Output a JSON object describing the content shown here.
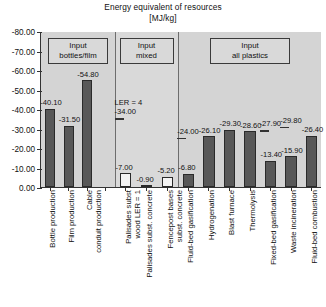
{
  "chart_data": {
    "type": "bar",
    "title": "Energy equivalent of resources",
    "subtitle": "[MJ/kg]",
    "xlabel": "",
    "ylabel": "",
    "ylim": [
      0,
      -80
    ],
    "y_ticks": [
      "0.00",
      "-10.00",
      "-20.00",
      "-30.00",
      "-40.00",
      "-50.00",
      "-60.00",
      "-70.00",
      "-80.00"
    ],
    "grid": false,
    "legend_position": "none",
    "axis_inverted": true,
    "note": "Negative values plotted as upward bars; y-axis runs 0.00 at bottom to -80.00 at top",
    "groups": [
      {
        "name": "Input bottles/film",
        "box_label_line1": "Input",
        "box_label_line2": "bottles/film",
        "bar_style": "filled",
        "categories": [
          "Bottle production",
          "Film production",
          "Cable\nconduit production"
        ],
        "category_lines": [
          [
            "Bottle production"
          ],
          [
            "Film production"
          ],
          [
            "Cable",
            "conduit production"
          ]
        ],
        "values": [
          -40.1,
          -31.5,
          -54.8
        ],
        "value_labels": [
          "-40.10",
          "-31.50",
          "-54.80"
        ],
        "annotations": [
          null,
          null,
          null
        ]
      },
      {
        "name": "Input mixed",
        "box_label_line1": "Input",
        "box_label_line2": "mixed",
        "bar_style": "hollow",
        "categories": [
          "Palisades subst\nwood LER = 1",
          "Palisades subst. concrete",
          "Fencepost bases\nsubst. concrete"
        ],
        "category_lines": [
          [
            "Palisades subst",
            "wood LER = 1"
          ],
          [
            "Palisades subst. concrete"
          ],
          [
            "Fencepost bases",
            "subst. concrete"
          ]
        ],
        "values": [
          -7.0,
          -0.9,
          -5.2
        ],
        "value_labels": [
          "-7.00",
          "-0.90",
          "-5.20"
        ],
        "annotations": [
          {
            "line1": "LER = 4",
            "line2": "-34.00",
            "value": -34.0,
            "marker": "dash"
          },
          null,
          null
        ]
      },
      {
        "name": "Input all plastics",
        "box_label_line1": "Input",
        "box_label_line2": "all plastics",
        "bar_style": "filled",
        "categories": [
          "Fluid-bed gasification",
          "Hydrogenation",
          "Blast furnace",
          "Thermolysis",
          "Fixed-bed gasification",
          "Waste incineration",
          "Fluid-bed combustion"
        ],
        "category_lines": [
          [
            "Fluid-bed gasification"
          ],
          [
            "Hydrogenation"
          ],
          [
            "Blast furnace"
          ],
          [
            "Thermolysis"
          ],
          [
            "Fixed-bed gasification"
          ],
          [
            "Waste incineration"
          ],
          [
            "Fluid-bed combustion"
          ]
        ],
        "values": [
          -6.8,
          -26.1,
          -29.3,
          -28.6,
          -13.4,
          -15.9,
          -26.4
        ],
        "value_labels": [
          "-6.80",
          "-26.10",
          "-29.30",
          "-28.60",
          "-13.40",
          "-15.90",
          "-26.40"
        ],
        "annotations": [
          {
            "line1": "-24.00",
            "line2": "",
            "value": -24.0,
            "marker": "dash"
          },
          null,
          null,
          null,
          {
            "line1": "-27.90",
            "line2": "",
            "value": -27.9,
            "marker": "dash"
          },
          {
            "line1": "-29.80",
            "line2": "",
            "value": -29.8,
            "marker": "dash"
          },
          null
        ]
      }
    ],
    "colors": {
      "bar_fill": "#585858",
      "bar_hollow_fill": "#f4f4f4",
      "bar_edge": "#2a2a2a",
      "plot_background": "#d4d4d4",
      "axis": "#333333",
      "text": "#111111"
    }
  }
}
